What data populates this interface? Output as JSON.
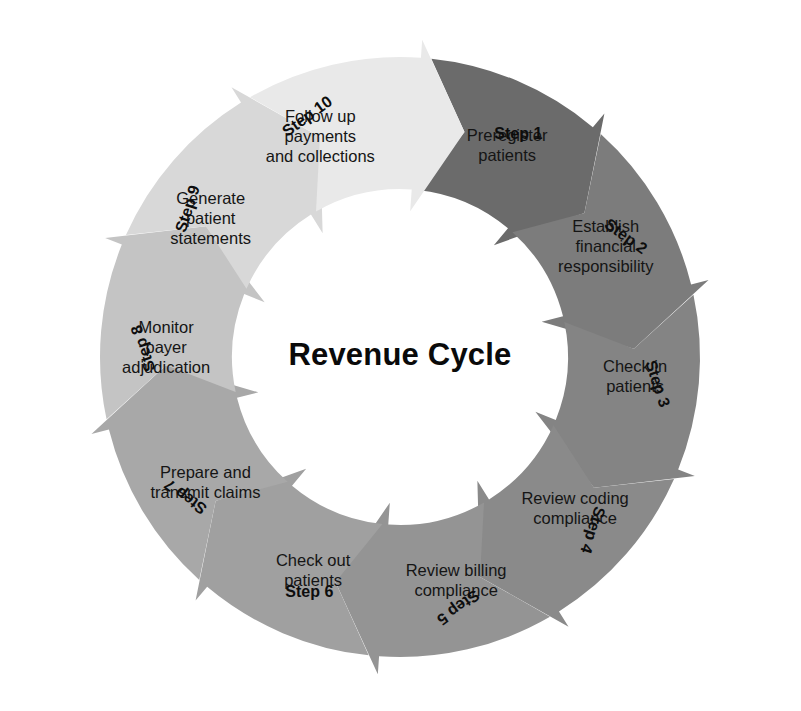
{
  "diagram": {
    "title": "Revenue Cycle",
    "type": "circular-process",
    "center": {
      "x": 400,
      "y": 357
    },
    "geometry": {
      "outer_radius": 300,
      "inner_radius": 168,
      "tip_overshoot_outer": 18,
      "tip_overshoot_inner": 22,
      "segment_span_degrees": 36,
      "overlap_degrees": 9,
      "start_angle_degrees": -84,
      "direction": "clockwise"
    },
    "background_color": "#ffffff",
    "text_color": "#151515",
    "steps": [
      {
        "number_label": "Step 1",
        "text": "Preregister patients",
        "lines": [
          "Preregister",
          "patients"
        ],
        "color": "#6b6b6b",
        "label_angle": -62,
        "label_radius": 252,
        "label_rotation": 0,
        "text_angle": -63,
        "text_radius": 236
      },
      {
        "number_label": "Step 2",
        "text": "Establish financial responsibility",
        "lines": [
          "Establish",
          "financial",
          "responsibility"
        ],
        "color": "#7c7c7c",
        "label_angle": -28,
        "label_radius": 255,
        "label_rotation": 36,
        "text_angle": -28,
        "text_radius": 233
      },
      {
        "number_label": "Step 3",
        "text": "Check in patients",
        "lines": [
          "Check in",
          "patients"
        ],
        "color": "#848484",
        "label_angle": 6,
        "label_radius": 258,
        "label_rotation": 72,
        "text_angle": 5,
        "text_radius": 236
      },
      {
        "number_label": "Step 4",
        "text": "Review coding compliance",
        "lines": [
          "Review coding",
          "compliance"
        ],
        "color": "#8a8a8a",
        "label_angle": 42,
        "label_radius": 258,
        "label_rotation": 108,
        "text_angle": 41,
        "text_radius": 232
      },
      {
        "number_label": "Step 5",
        "text": "Review billing compliance",
        "lines": [
          "Review billing",
          "compliance"
        ],
        "color": "#949494",
        "label_angle": 77,
        "label_radius": 256,
        "label_rotation": 144,
        "text_angle": 76,
        "text_radius": 232
      },
      {
        "number_label": "Step 6",
        "text": "Check out patients",
        "lines": [
          "Check out",
          "patients"
        ],
        "color": "#a0a0a0",
        "label_angle": 111,
        "label_radius": 253,
        "label_rotation": 0,
        "text_angle": 112,
        "text_radius": 232
      },
      {
        "number_label": "Step 7",
        "text": "Prepare and transmit claims",
        "lines": [
          "Prepare and",
          "transmit claims"
        ],
        "color": "#a8a8a8",
        "label_angle": 147,
        "label_radius": 255,
        "label_rotation": -144,
        "text_angle": 147,
        "text_radius": 232
      },
      {
        "number_label": "Step 8",
        "text": "Monitor payer adjudication",
        "lines": [
          "Monitor",
          "payer",
          "adjudication"
        ],
        "color": "#c4c4c4",
        "label_angle": 182,
        "label_radius": 256,
        "label_rotation": -108,
        "text_angle": 182,
        "text_radius": 234
      },
      {
        "number_label": "Step 9",
        "text": "Generate patient statements",
        "lines": [
          "Generate",
          "patient",
          "statements"
        ],
        "color": "#d8d8d8",
        "label_angle": 215,
        "label_radius": 258,
        "label_rotation": -72,
        "text_angle": 216,
        "text_radius": 234
      },
      {
        "number_label": "Step 10",
        "text": "Follow up payments and collections",
        "lines": [
          "Follow up",
          "payments",
          "and collections"
        ],
        "color": "#e9e9e9",
        "label_angle": 249,
        "label_radius": 257,
        "label_rotation": -36,
        "text_angle": 250,
        "text_radius": 233
      }
    ]
  }
}
